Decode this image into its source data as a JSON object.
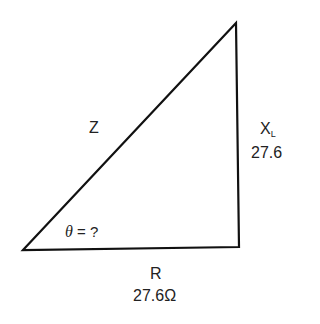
{
  "diagram": {
    "type": "impedance-triangle",
    "hypotenuse_label": "Z",
    "vertical_side": {
      "symbol": "X",
      "subscript": "L",
      "value": "27.6"
    },
    "horizontal_side": {
      "symbol": "R",
      "value": "27.6Ω"
    },
    "angle": {
      "symbol": "θ",
      "text": "= ?"
    },
    "line_color": "#111111"
  }
}
